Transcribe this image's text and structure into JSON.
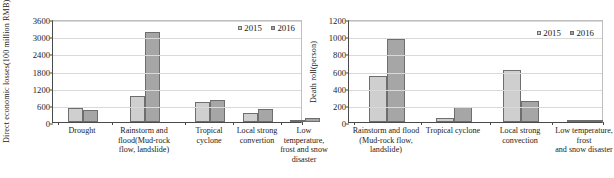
{
  "chart_data": [
    {
      "panel": "left",
      "type": "bar",
      "title": "",
      "xlabel": "",
      "ylabel": "Direct economic losses (100 million RMB)",
      "ylabel_line1": "Direct economic losses",
      "ylabel_line2": "(100 million RMB)",
      "ylim": [
        0,
        3600
      ],
      "ytick_step": 600,
      "yticks": [
        0,
        600,
        1200,
        1800,
        2400,
        3000,
        3600
      ],
      "ytick_labels": [
        "0",
        "600",
        "1200",
        "1800",
        "2400",
        "3000",
        "3600"
      ],
      "grid": true,
      "legend_position": "top-right",
      "categories": [
        "Drought",
        "Rainstorm and flood(Mud-rock flow, landslide)",
        "Tropical cyclone",
        "Local strong convertion",
        "Low temperature, frost and snow disaster"
      ],
      "category_lines": [
        [
          "Drought"
        ],
        [
          "Rainstorm and",
          "flood(Mud-rock",
          "flow, landslide)"
        ],
        [
          "Tropical",
          "cyclone"
        ],
        [
          "Local strong",
          "convertion"
        ],
        [
          "Low",
          "temperature,",
          "frost and snow",
          "disaster"
        ]
      ],
      "series": [
        {
          "name": "2015",
          "values": [
            490,
            900,
            700,
            300,
            60
          ]
        },
        {
          "name": "2016",
          "values": [
            420,
            3130,
            760,
            450,
            130
          ]
        }
      ]
    },
    {
      "panel": "right",
      "type": "bar",
      "title": "",
      "xlabel": "",
      "ylabel": "Death roll(person)",
      "ylim": [
        0,
        1200
      ],
      "ytick_step": 200,
      "yticks": [
        0,
        200,
        400,
        600,
        800,
        1000,
        1200
      ],
      "ytick_labels": [
        "0",
        "200",
        "400",
        "600",
        "800",
        "1000",
        "1200"
      ],
      "grid": true,
      "legend_position": "top-right",
      "categories": [
        "Rainstorm and flood (Mud-rock flow, landslide)",
        "Tropical cyclone",
        "Local strong convection",
        "Low temperature, frost and snow disaster"
      ],
      "category_lines": [
        [
          "Rainstorm and flood",
          "(Mud-rock flow,",
          "landslide)"
        ],
        [
          "Tropical cyclone"
        ],
        [
          "Local strong",
          "convection"
        ],
        [
          "Low temperature, frost",
          "and snow disaster"
        ]
      ],
      "series": [
        {
          "name": "2015",
          "values": [
            535,
            50,
            610,
            8
          ]
        },
        {
          "name": "2016",
          "values": [
            965,
            170,
            245,
            12
          ]
        }
      ]
    }
  ],
  "legend": {
    "items": [
      {
        "label": "2015",
        "color": "#cfcfcf"
      },
      {
        "label": "2016",
        "color": "#a6a6a6"
      }
    ]
  },
  "colors": {
    "series_2015": "#cfcfcf",
    "series_2016": "#a6a6a6",
    "bar_border": "#6e6e6e",
    "axis": "#4a4a4a",
    "gridline": "#d9d9d9",
    "background": "#ffffff"
  }
}
